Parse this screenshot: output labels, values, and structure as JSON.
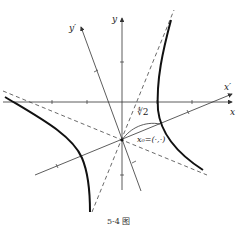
{
  "figure": {
    "caption": "5-4 图",
    "labels": {
      "x_axis": "x",
      "y_axis": "y",
      "x_prime_axis": "x′",
      "y_prime_axis": "y′",
      "distance": "∜2",
      "point": "x₀=(·,·)"
    },
    "colors": {
      "curve": "#111111",
      "axis": "#333333",
      "asymptote": "#444444"
    }
  }
}
